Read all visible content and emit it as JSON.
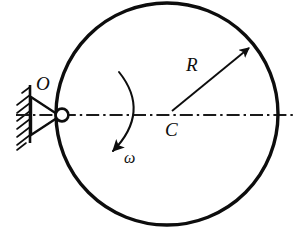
{
  "figure": {
    "background_color": "#ffffff",
    "stroke_color": "#0d0d0d",
    "width": 298,
    "height": 229
  },
  "labels": {
    "pivot": "O",
    "center": "C",
    "radius": "R",
    "angular_velocity": "ω"
  },
  "geometry": {
    "disk": {
      "name": "disk-outline",
      "center_x": 167,
      "center_y": 114,
      "radius": 111,
      "stroke_width": 3.2
    },
    "pivot_pin": {
      "name": "pin-joint",
      "x": 62,
      "y": 115,
      "radius": 6.2
    },
    "axis_line": {
      "name": "center-axis-line",
      "x1": 18,
      "y1": 115,
      "x2": 296,
      "y2": 115,
      "style": "dash-dot"
    },
    "radius_arrow": {
      "name": "radius-arrow",
      "x1": 170,
      "y1": 112,
      "x2": 250,
      "y2": 47
    },
    "omega_arc": {
      "name": "omega-arc",
      "start_x": 119,
      "start_y": 72,
      "end_x": 114,
      "end_y": 150,
      "bulge_x": 146,
      "bulge_y": 113
    },
    "support": {
      "name": "wall-support",
      "wall_x": 30,
      "wall_top": 86,
      "wall_bottom": 142,
      "hatch_count": 7,
      "triangle": [
        [
          30,
          96
        ],
        [
          30,
          136
        ],
        [
          60,
          116
        ]
      ]
    }
  }
}
